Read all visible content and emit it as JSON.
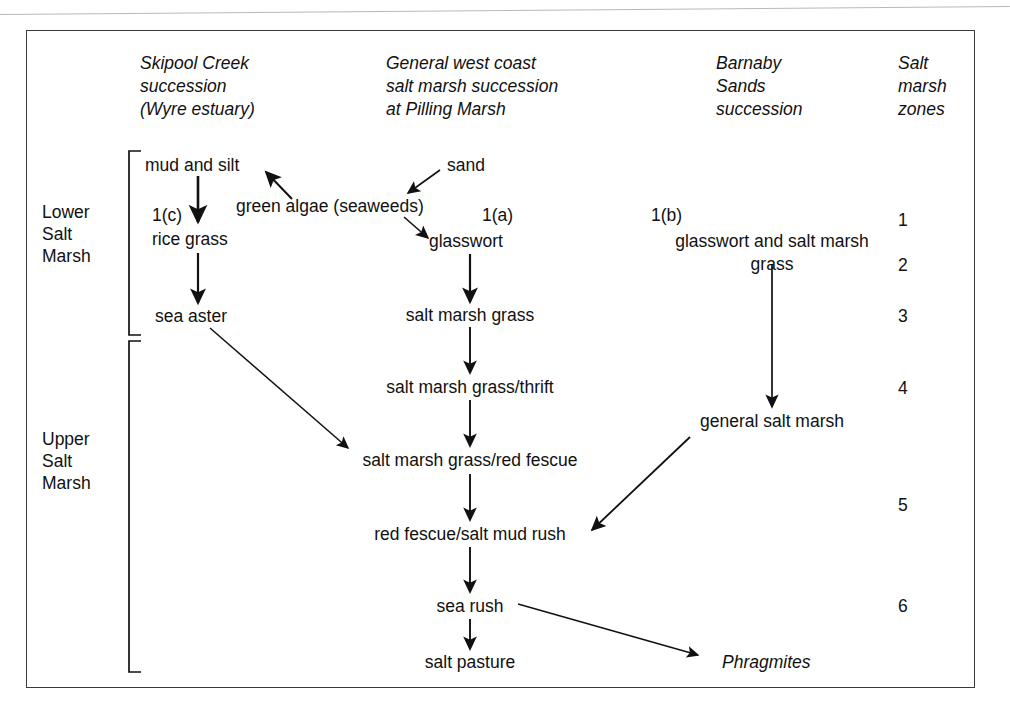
{
  "figure": {
    "type": "flow-diagram",
    "frame_border_color": "#3a3a3a",
    "text_color": "#111111"
  },
  "column_headers": [
    {
      "id": "skipool",
      "text": "Skipool Creek\nsuccession\n(Wyre estuary)"
    },
    {
      "id": "pilling",
      "text": "General west coast\nsalt marsh succession\nat Pilling Marsh"
    },
    {
      "id": "barnaby",
      "text": "Barnaby\nSands\nsuccession"
    },
    {
      "id": "zones",
      "text": "Salt\nmarsh\nzones"
    }
  ],
  "side_labels": [
    {
      "id": "lower",
      "text": "Lower\nSalt\nMarsh"
    },
    {
      "id": "upper",
      "text": "Upper\nSalt\nMarsh"
    }
  ],
  "succession_tags": [
    {
      "id": "tag_a",
      "text": "1(a)"
    },
    {
      "id": "tag_b",
      "text": "1(b)"
    },
    {
      "id": "tag_c",
      "text": "1(c)"
    }
  ],
  "nodes": {
    "mud_and_silt": "mud and silt",
    "sand": "sand",
    "green_algae": "green algae (seaweeds)",
    "rice_grass": "rice grass",
    "glasswort": "glasswort",
    "glasswort_and_grass": "glasswort and salt marsh\ngrass",
    "sea_aster": "sea aster",
    "salt_marsh_grass": "salt marsh grass",
    "grass_thrift": "salt marsh grass/thrift",
    "general_salt_marsh": "general salt marsh",
    "grass_red_fescue": "salt marsh grass/red fescue",
    "red_fescue_mud_rush": "red fescue/salt mud rush",
    "sea_rush": "sea rush",
    "salt_pasture": "salt pasture",
    "phragmites": "Phragmites"
  },
  "zone_numbers": [
    "1",
    "2",
    "3",
    "4",
    "5",
    "6"
  ],
  "flow_edges": [
    {
      "from": "green_algae",
      "to": "mud_and_silt"
    },
    {
      "from": "sand",
      "to": "green_algae"
    },
    {
      "from": "green_algae",
      "to": "glasswort"
    },
    {
      "from": "mud_and_silt",
      "to": "rice_grass"
    },
    {
      "from": "rice_grass",
      "to": "sea_aster"
    },
    {
      "from": "glasswort",
      "to": "salt_marsh_grass"
    },
    {
      "from": "glasswort_and_grass",
      "to": "general_salt_marsh"
    },
    {
      "from": "sea_aster",
      "to": "grass_red_fescue"
    },
    {
      "from": "salt_marsh_grass",
      "to": "grass_thrift"
    },
    {
      "from": "grass_thrift",
      "to": "grass_red_fescue"
    },
    {
      "from": "grass_red_fescue",
      "to": "red_fescue_mud_rush"
    },
    {
      "from": "general_salt_marsh",
      "to": "red_fescue_mud_rush"
    },
    {
      "from": "red_fescue_mud_rush",
      "to": "sea_rush"
    },
    {
      "from": "sea_rush",
      "to": "salt_pasture"
    },
    {
      "from": "sea_rush",
      "to": "phragmites"
    }
  ]
}
